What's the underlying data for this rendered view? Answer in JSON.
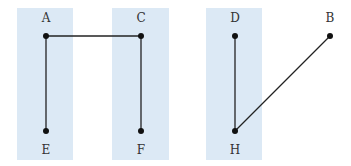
{
  "colors": {
    "column_fill": "#dce9f5",
    "edge": "#222222",
    "node": "#111111",
    "label": "#333333"
  },
  "columns": [
    {
      "id": "col-1",
      "nodes": [
        "A",
        "E"
      ]
    },
    {
      "id": "col-2",
      "nodes": [
        "C",
        "F"
      ]
    },
    {
      "id": "col-3",
      "nodes": [
        "D",
        "H"
      ]
    }
  ],
  "nodes": [
    {
      "id": "A",
      "label": "A",
      "label_pos": "above"
    },
    {
      "id": "C",
      "label": "C",
      "label_pos": "above"
    },
    {
      "id": "D",
      "label": "D",
      "label_pos": "above"
    },
    {
      "id": "B",
      "label": "B",
      "label_pos": "above"
    },
    {
      "id": "E",
      "label": "E",
      "label_pos": "below"
    },
    {
      "id": "F",
      "label": "F",
      "label_pos": "below"
    },
    {
      "id": "H",
      "label": "H",
      "label_pos": "below"
    }
  ],
  "edges": [
    {
      "from": "A",
      "to": "C"
    },
    {
      "from": "A",
      "to": "E"
    },
    {
      "from": "C",
      "to": "F"
    },
    {
      "from": "D",
      "to": "H"
    },
    {
      "from": "H",
      "to": "B"
    }
  ]
}
